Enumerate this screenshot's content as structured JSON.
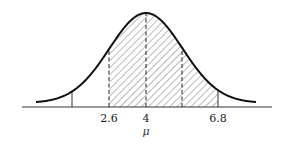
{
  "diagram": {
    "type": "normal-distribution",
    "mean_label": "4",
    "mean_symbol": "μ",
    "tick_labels": [
      "2.6",
      "4",
      "6.8"
    ],
    "shaded_region": {
      "from": "2.6",
      "to": "6.8"
    },
    "markers": [
      {
        "position": "left-tail",
        "style": "solid"
      },
      {
        "position": "2.6",
        "style": "dashed"
      },
      {
        "position": "4",
        "style": "dashed"
      },
      {
        "position": "+1sigma",
        "style": "dashed"
      },
      {
        "position": "6.8",
        "style": "solid"
      }
    ],
    "colors": {
      "curve": "#111111",
      "hatch": "#555555",
      "axis": "#333333"
    }
  }
}
